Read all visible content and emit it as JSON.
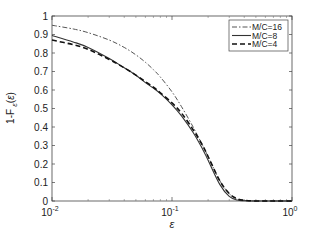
{
  "chart_data": {
    "type": "line",
    "title": "",
    "xlabel": "ε",
    "ylabel": "1-F_ε(ε)",
    "xscale": "log",
    "xlim": [
      0.01,
      1
    ],
    "ylim": [
      0,
      1
    ],
    "grid": false,
    "legend_position": "upper right",
    "x_ticks": [
      {
        "value": 0.01,
        "base": "10",
        "exp": "-2"
      },
      {
        "value": 0.1,
        "base": "10",
        "exp": "-1"
      },
      {
        "value": 1,
        "base": "10",
        "exp": "0"
      }
    ],
    "y_ticks": [
      "0",
      "0.1",
      "0.2",
      "0.3",
      "0.4",
      "0.5",
      "0.6",
      "0.7",
      "0.8",
      "0.9",
      "1"
    ],
    "x": [
      0.01,
      0.015,
      0.02,
      0.03,
      0.04,
      0.05,
      0.06,
      0.07,
      0.08,
      0.1,
      0.12,
      0.15,
      0.18,
      0.2,
      0.25,
      0.3,
      0.35,
      0.4,
      0.5,
      0.7,
      1.0
    ],
    "series": [
      {
        "name": "M/C=16",
        "style": "dashdot",
        "color": "#555555",
        "values": [
          0.95,
          0.93,
          0.91,
          0.87,
          0.83,
          0.79,
          0.75,
          0.71,
          0.67,
          0.59,
          0.51,
          0.4,
          0.3,
          0.24,
          0.11,
          0.04,
          0.01,
          0.003,
          0.0,
          0.0,
          0.0
        ]
      },
      {
        "name": "M/C=8",
        "style": "solid",
        "color": "#333333",
        "values": [
          0.895,
          0.86,
          0.83,
          0.77,
          0.72,
          0.68,
          0.64,
          0.61,
          0.58,
          0.52,
          0.46,
          0.37,
          0.28,
          0.22,
          0.09,
          0.025,
          0.005,
          0.001,
          0.0,
          0.0,
          0.0
        ]
      },
      {
        "name": "M/C=4",
        "style": "dashed",
        "color": "#111111",
        "values": [
          0.87,
          0.845,
          0.82,
          0.765,
          0.72,
          0.68,
          0.645,
          0.615,
          0.585,
          0.53,
          0.475,
          0.385,
          0.3,
          0.24,
          0.11,
          0.04,
          0.012,
          0.004,
          0.0,
          0.0,
          0.0
        ]
      }
    ]
  }
}
